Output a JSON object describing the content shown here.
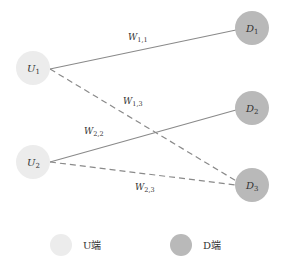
{
  "colors": {
    "u_node": "#ececec",
    "d_node": "#b9b9b9",
    "edge": "#8a8a8a",
    "text": "#333333"
  },
  "nodes": {
    "U1": {
      "main": "U",
      "sub": "1",
      "cx": 33,
      "cy": 68
    },
    "U2": {
      "main": "U",
      "sub": "2",
      "cx": 33,
      "cy": 162
    },
    "D1": {
      "main": "D",
      "sub": "1",
      "cx": 252,
      "cy": 28
    },
    "D2": {
      "main": "D",
      "sub": "2",
      "cx": 252,
      "cy": 108
    },
    "D3": {
      "main": "D",
      "sub": "3",
      "cx": 252,
      "cy": 185
    }
  },
  "edges": [
    {
      "from": "U1",
      "to": "D1",
      "style": "solid",
      "label_main": "W",
      "label_sub": "1,1"
    },
    {
      "from": "U1",
      "to": "D3",
      "style": "dashed",
      "label_main": "W",
      "label_sub": "1,3"
    },
    {
      "from": "U2",
      "to": "D2",
      "style": "solid",
      "label_main": "W",
      "label_sub": "2,2"
    },
    {
      "from": "U2",
      "to": "D3",
      "style": "dashed",
      "label_main": "W",
      "label_sub": "2,3"
    }
  ],
  "legend": {
    "u_label": "U端",
    "d_label": "D端"
  }
}
